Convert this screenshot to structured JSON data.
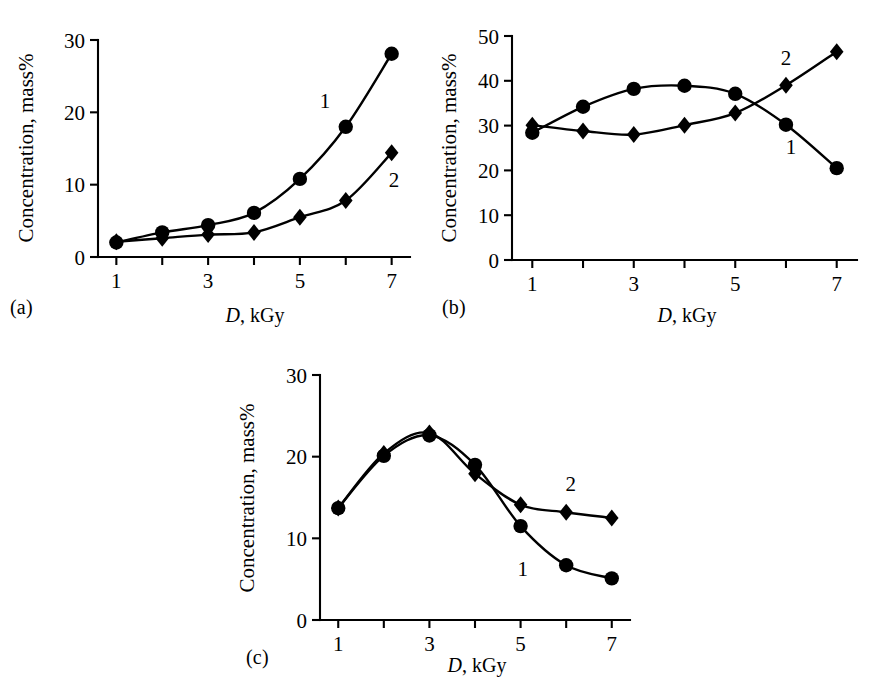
{
  "figure": {
    "background": "#ffffff",
    "ink_color": "#000000",
    "panel_count": 3
  },
  "panels": [
    {
      "caption": "(a)",
      "chart_data": {
        "type": "line",
        "title": "",
        "subtitle": "",
        "xlabel": "D, kGy",
        "xlabel_italic_part": "D",
        "xlabel_rest": ", kGy",
        "ylabel": "Concentration, mass%",
        "xlim": [
          0.6,
          7.4
        ],
        "ylim": [
          0,
          30
        ],
        "xticks": [
          1,
          2,
          3,
          4,
          5,
          6,
          7
        ],
        "xticklabels": [
          "1",
          "",
          "3",
          "",
          "5",
          "",
          "7"
        ],
        "yticks": [
          0,
          10,
          20,
          30
        ],
        "yticklabels": [
          "0",
          "10",
          "20",
          "30"
        ],
        "grid": false,
        "legend": "inline-labels",
        "x": [
          1,
          2,
          3,
          4,
          5,
          6,
          7
        ],
        "series": [
          {
            "name": "1",
            "marker": "circle",
            "label_position": {
              "x": 5.55,
              "y": 21.5
            },
            "values": [
              2.0,
              3.4,
              4.4,
              6.1,
              10.8,
              18.0,
              28.1
            ]
          },
          {
            "name": "2",
            "marker": "diamond",
            "label_position": {
              "x": 7.05,
              "y": 10.7
            },
            "values": [
              2.1,
              2.6,
              3.1,
              3.4,
              5.5,
              7.8,
              14.4
            ]
          }
        ]
      }
    },
    {
      "caption": "(b)",
      "chart_data": {
        "type": "line",
        "title": "",
        "subtitle": "",
        "xlabel": "D, kGy",
        "xlabel_italic_part": "D",
        "xlabel_rest": ", kGy",
        "ylabel": "Concentration, mass%",
        "xlim": [
          0.6,
          7.4
        ],
        "ylim": [
          0,
          50
        ],
        "xticks": [
          1,
          2,
          3,
          4,
          5,
          6,
          7
        ],
        "xticklabels": [
          "1",
          "",
          "3",
          "",
          "5",
          "",
          "7"
        ],
        "yticks": [
          0,
          10,
          20,
          30,
          40,
          50
        ],
        "yticklabels": [
          "0",
          "10",
          "20",
          "30",
          "40",
          "50"
        ],
        "grid": false,
        "legend": "inline-labels",
        "x": [
          1,
          2,
          3,
          4,
          5,
          6,
          7
        ],
        "series": [
          {
            "name": "1",
            "marker": "circle",
            "label_position": {
              "x": 6.1,
              "y": 25.2
            },
            "values": [
              28.4,
              34.2,
              38.2,
              38.9,
              37.1,
              30.2,
              20.5
            ]
          },
          {
            "name": "2",
            "marker": "diamond",
            "label_position": {
              "x": 6.0,
              "y": 45.0
            },
            "values": [
              30.1,
              28.8,
              28.0,
              30.1,
              32.8,
              39.0,
              46.5
            ]
          }
        ]
      }
    },
    {
      "caption": "(c)",
      "chart_data": {
        "type": "line",
        "title": "",
        "subtitle": "",
        "xlabel": "D, kGy",
        "xlabel_italic_part": "D",
        "xlabel_rest": ", kGy",
        "ylabel": "Concentration, mass%",
        "xlim": [
          0.6,
          7.4
        ],
        "ylim": [
          0,
          30
        ],
        "xticks": [
          1,
          2,
          3,
          4,
          5,
          6,
          7
        ],
        "xticklabels": [
          "1",
          "",
          "3",
          "",
          "5",
          "",
          "7"
        ],
        "yticks": [
          0,
          10,
          20,
          30
        ],
        "yticklabels": [
          "0",
          "10",
          "20",
          "30"
        ],
        "grid": false,
        "legend": "inline-labels",
        "x": [
          1,
          2,
          3,
          4,
          5,
          6,
          7
        ],
        "series": [
          {
            "name": "1",
            "marker": "circle",
            "label_position": {
              "x": 5.05,
              "y": 6.2
            },
            "values": [
              13.7,
              20.1,
              22.6,
              19.0,
              11.5,
              6.7,
              5.1
            ]
          },
          {
            "name": "2",
            "marker": "diamond",
            "label_position": {
              "x": 6.1,
              "y": 16.6
            },
            "values": [
              13.7,
              20.4,
              22.9,
              17.9,
              14.1,
              13.2,
              12.5
            ]
          }
        ]
      }
    }
  ]
}
